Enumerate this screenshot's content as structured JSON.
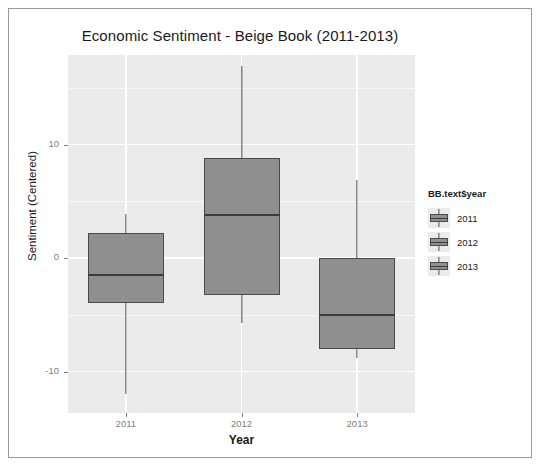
{
  "chart_data": {
    "type": "box",
    "title": "Economic Sentiment - Beige Book (2011-2013)",
    "xlabel": "Year",
    "ylabel": "Sentiment (Centered)",
    "categories": [
      "2011",
      "2012",
      "2013"
    ],
    "yticks": [
      10,
      0,
      -10
    ],
    "ytick_labels": [
      "10",
      "0",
      "-10"
    ],
    "ylim": [
      -13.5,
      18.0
    ],
    "grid": true,
    "legend_position": "right",
    "legend_title": "BB.text$year",
    "legend_entries": [
      "2011",
      "2012",
      "2013"
    ],
    "panel_background": "#ebebeb",
    "box_fill": "#8f8f8f",
    "box_border": "#4a4a4a",
    "boxes": [
      {
        "category": "2011",
        "whisker_low": -12.0,
        "q1": -4.0,
        "median": -1.5,
        "q3": 2.2,
        "whisker_high": 3.9
      },
      {
        "category": "2012",
        "whisker_low": -5.7,
        "q1": -3.3,
        "median": 3.8,
        "q3": 8.8,
        "whisker_high": 16.9
      },
      {
        "category": "2013",
        "whisker_low": -8.8,
        "q1": -8.0,
        "median": -5.0,
        "q3": 0.0,
        "whisker_high": 6.9
      }
    ]
  }
}
